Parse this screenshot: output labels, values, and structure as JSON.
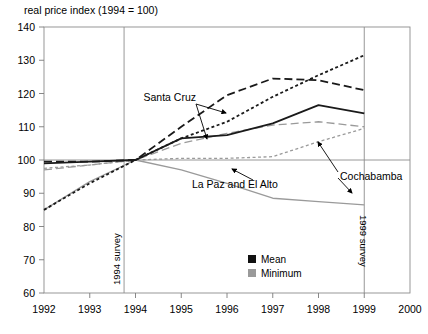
{
  "chart_data": {
    "type": "line",
    "title": "",
    "ylabel": "real price index (1994 = 100)",
    "xlabel": "",
    "xlim": [
      1992,
      2000
    ],
    "ylim": [
      60,
      140
    ],
    "grid": false,
    "legend_position": "inside-bottom-right",
    "xticks": [
      "1992",
      "1993",
      "1994",
      "1995",
      "1996",
      "1997",
      "1998",
      "1999",
      "2000"
    ],
    "yticks": [
      "60",
      "70",
      "80",
      "90",
      "100",
      "110",
      "120",
      "130",
      "140"
    ],
    "x": [
      1992,
      1993,
      1994,
      1995,
      1996,
      1997,
      1998,
      1999
    ],
    "series": [
      {
        "name": "Santa Cruz Mean",
        "statistic": "Mean",
        "city": "Santa Cruz",
        "color": "#1a1a1a",
        "style": "dashed-long",
        "values": [
          99.5,
          99.5,
          100.0,
          110.0,
          119.5,
          124.5,
          124.0,
          121.0
        ]
      },
      {
        "name": "La Paz and El Alto Mean",
        "statistic": "Mean",
        "city": "La Paz and El Alto",
        "color": "#1a1a1a",
        "style": "solid",
        "values": [
          99.0,
          99.5,
          100.0,
          106.5,
          107.5,
          111.0,
          116.5,
          114.0
        ]
      },
      {
        "name": "Cochabamba Mean",
        "statistic": "Mean",
        "city": "Cochabamba",
        "color": "#1a1a1a",
        "style": "dotted-short",
        "values": [
          85.0,
          93.0,
          100.0,
          106.5,
          111.5,
          119.0,
          125.5,
          131.5
        ]
      },
      {
        "name": "Santa Cruz Minimum",
        "statistic": "Minimum",
        "city": "Santa Cruz",
        "color": "#9a9a9a",
        "style": "dashed-long",
        "values": [
          97.0,
          98.5,
          100.0,
          105.0,
          108.0,
          110.5,
          111.5,
          110.0
        ]
      },
      {
        "name": "La Paz and El Alto Minimum",
        "statistic": "Minimum",
        "city": "La Paz and El Alto",
        "color": "#9a9a9a",
        "style": "dotted-short",
        "values": [
          97.5,
          98.5,
          100.0,
          100.5,
          100.5,
          101.0,
          105.5,
          109.5
        ]
      },
      {
        "name": "Cochabamba Minimum",
        "statistic": "Minimum",
        "city": "Cochabamba",
        "color": "#9a9a9a",
        "style": "solid",
        "values": [
          85.0,
          93.5,
          100.0,
          97.0,
          93.0,
          88.5,
          87.5,
          86.5
        ]
      }
    ],
    "annotations": [
      {
        "text": "Santa Cruz",
        "x": 1994.1,
        "y": 119.0
      },
      {
        "text": "La Paz and El Alto",
        "x": 1996.2,
        "y": 98.0
      },
      {
        "text": "Cochabamba",
        "x": 1998.0,
        "y": 97.5
      }
    ],
    "vlines": [
      {
        "label": "1994 survey",
        "x": 1993.75
      },
      {
        "label": "1999 survey",
        "x": 1999.0
      }
    ],
    "hline": {
      "y": 100
    },
    "legend": [
      {
        "label": "Mean",
        "color": "#111111"
      },
      {
        "label": "Minimum",
        "color": "#9a9a9a"
      }
    ]
  }
}
